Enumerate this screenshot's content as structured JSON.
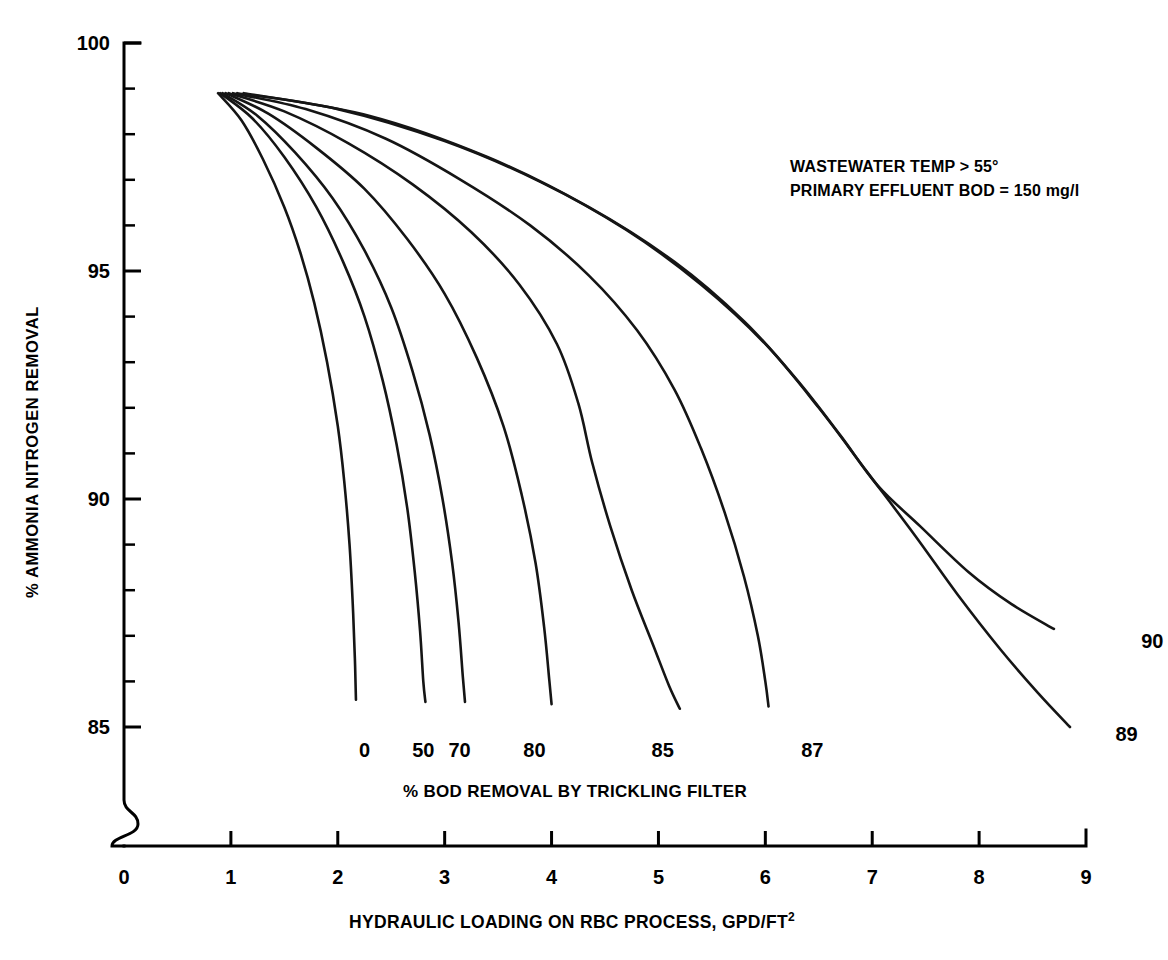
{
  "figure": {
    "background": "#ffffff",
    "line_color": "#151515",
    "annotation": {
      "line1": "WASTEWATER TEMP > 55°",
      "line2": "PRIMARY EFFLUENT BOD = 150 mg/l"
    },
    "family_label": "% BOD REMOVAL BY TRICKLING FILTER"
  },
  "chart_data": {
    "type": "line",
    "title": "",
    "subtitle": "",
    "xlabel": "HYDRAULIC LOADING ON RBC PROCESS, GPD/FT2",
    "xlabel_base": "HYDRAULIC LOADING ON RBC PROCESS, GPD/FT",
    "xlabel_superscript": "2",
    "ylabel": "% AMMONIA NITROGEN REMOVAL",
    "xlim": [
      0,
      9
    ],
    "ylim": [
      84.2,
      100
    ],
    "y_axis_break": true,
    "y_break_note": "axis broken between 0 and 85",
    "grid": false,
    "legend": "inline curve end labels",
    "xticks": [
      0,
      1,
      2,
      3,
      4,
      5,
      6,
      7,
      8,
      9
    ],
    "xtick_labels": [
      "0",
      "1",
      "2",
      "3",
      "4",
      "5",
      "6",
      "7",
      "8",
      "9"
    ],
    "yticks": [
      85,
      86,
      87,
      88,
      89,
      90,
      91,
      92,
      93,
      94,
      95,
      96,
      97,
      98,
      99,
      100
    ],
    "ytick_labels_major": [
      "100",
      "95",
      "90",
      "85"
    ],
    "ytick_major_values": [
      100,
      95,
      90,
      85
    ],
    "annotations": [
      "WASTEWATER TEMP > 55°",
      "PRIMARY EFFLUENT BOD = 150 mg/l",
      "% BOD REMOVAL BY TRICKLING FILTER"
    ],
    "series": [
      {
        "name": "0",
        "label": "0",
        "points": [
          [
            0.88,
            98.9
          ],
          [
            1.1,
            98.3
          ],
          [
            1.3,
            97.45
          ],
          [
            1.5,
            96.4
          ],
          [
            1.65,
            95.4
          ],
          [
            1.78,
            94.3
          ],
          [
            1.9,
            93.0
          ],
          [
            2.0,
            91.6
          ],
          [
            2.06,
            90.4
          ],
          [
            2.11,
            89.0
          ],
          [
            2.14,
            87.7
          ],
          [
            2.16,
            86.5
          ],
          [
            2.17,
            85.6
          ]
        ]
      },
      {
        "name": "50",
        "label": "50",
        "points": [
          [
            0.9,
            98.9
          ],
          [
            1.2,
            98.35
          ],
          [
            1.5,
            97.5
          ],
          [
            1.8,
            96.4
          ],
          [
            2.05,
            95.2
          ],
          [
            2.25,
            94.0
          ],
          [
            2.42,
            92.6
          ],
          [
            2.55,
            91.2
          ],
          [
            2.65,
            89.8
          ],
          [
            2.72,
            88.4
          ],
          [
            2.77,
            87.1
          ],
          [
            2.8,
            86.0
          ],
          [
            2.82,
            85.55
          ]
        ]
      },
      {
        "name": "70",
        "label": "70",
        "points": [
          [
            0.92,
            98.9
          ],
          [
            1.25,
            98.4
          ],
          [
            1.6,
            97.6
          ],
          [
            1.95,
            96.6
          ],
          [
            2.25,
            95.45
          ],
          [
            2.5,
            94.2
          ],
          [
            2.7,
            92.8
          ],
          [
            2.86,
            91.4
          ],
          [
            2.98,
            90.0
          ],
          [
            3.07,
            88.6
          ],
          [
            3.13,
            87.3
          ],
          [
            3.17,
            86.1
          ],
          [
            3.19,
            85.55
          ]
        ]
      },
      {
        "name": "80",
        "label": "80",
        "points": [
          [
            0.95,
            98.9
          ],
          [
            1.35,
            98.45
          ],
          [
            1.8,
            97.7
          ],
          [
            2.25,
            96.8
          ],
          [
            2.65,
            95.7
          ],
          [
            3.0,
            94.5
          ],
          [
            3.3,
            93.1
          ],
          [
            3.55,
            91.6
          ],
          [
            3.72,
            90.1
          ],
          [
            3.85,
            88.6
          ],
          [
            3.93,
            87.2
          ],
          [
            3.98,
            86.0
          ],
          [
            4.0,
            85.5
          ]
        ]
      },
      {
        "name": "85",
        "label": "85",
        "points": [
          [
            0.98,
            98.9
          ],
          [
            1.5,
            98.5
          ],
          [
            2.1,
            97.8
          ],
          [
            2.7,
            96.9
          ],
          [
            3.25,
            95.85
          ],
          [
            3.7,
            94.7
          ],
          [
            4.05,
            93.4
          ],
          [
            4.25,
            92.1
          ],
          [
            4.38,
            90.8
          ],
          [
            4.55,
            89.4
          ],
          [
            4.75,
            88.0
          ],
          [
            4.95,
            86.8
          ],
          [
            5.1,
            85.9
          ],
          [
            5.2,
            85.4
          ]
        ]
      },
      {
        "name": "87",
        "label": "87",
        "points": [
          [
            1.02,
            98.9
          ],
          [
            1.7,
            98.55
          ],
          [
            2.45,
            97.9
          ],
          [
            3.15,
            97.0
          ],
          [
            3.8,
            96.0
          ],
          [
            4.35,
            94.9
          ],
          [
            4.8,
            93.7
          ],
          [
            5.15,
            92.4
          ],
          [
            5.4,
            91.1
          ],
          [
            5.62,
            89.7
          ],
          [
            5.8,
            88.3
          ],
          [
            5.93,
            87.0
          ],
          [
            6.0,
            86.0
          ],
          [
            6.03,
            85.45
          ]
        ]
      },
      {
        "name": "89",
        "label": "89",
        "points": [
          [
            1.06,
            98.9
          ],
          [
            2.0,
            98.55
          ],
          [
            3.0,
            97.85
          ],
          [
            3.9,
            96.95
          ],
          [
            4.7,
            95.9
          ],
          [
            5.4,
            94.7
          ],
          [
            6.0,
            93.4
          ],
          [
            6.5,
            92.0
          ],
          [
            6.95,
            90.6
          ],
          [
            7.4,
            89.2
          ],
          [
            7.8,
            87.9
          ],
          [
            8.2,
            86.7
          ],
          [
            8.55,
            85.75
          ],
          [
            8.85,
            85.0
          ]
        ]
      },
      {
        "name": "90",
        "label": "90",
        "points": [
          [
            1.12,
            98.9
          ],
          [
            2.3,
            98.4
          ],
          [
            3.4,
            97.5
          ],
          [
            4.35,
            96.4
          ],
          [
            5.15,
            95.2
          ],
          [
            5.8,
            93.9
          ],
          [
            6.3,
            92.6
          ],
          [
            6.7,
            91.4
          ],
          [
            7.05,
            90.3
          ],
          [
            7.45,
            89.4
          ],
          [
            7.9,
            88.4
          ],
          [
            8.3,
            87.7
          ],
          [
            8.7,
            87.15
          ]
        ]
      }
    ],
    "curve_end_labels": [
      {
        "label": "0",
        "x": 2.25,
        "y": 85.0
      },
      {
        "label": "50",
        "x": 2.8,
        "y": 85.0
      },
      {
        "label": "70",
        "x": 3.14,
        "y": 85.0
      },
      {
        "label": "80",
        "x": 3.84,
        "y": 85.0
      },
      {
        "label": "85",
        "x": 5.04,
        "y": 85.0
      },
      {
        "label": "87",
        "x": 6.44,
        "y": 85.0
      },
      {
        "label": "89",
        "x": 9.38,
        "y": 85.35
      },
      {
        "label": "90",
        "x": 9.62,
        "y": 87.4
      }
    ]
  }
}
